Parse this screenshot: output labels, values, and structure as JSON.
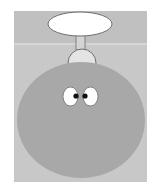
{
  "illustration": {
    "subject": "cartoon bomb character with face",
    "canvas": {
      "width": 161,
      "height": 193,
      "background": "#ffffff"
    },
    "panel": {
      "x": 14,
      "y": 11,
      "width": 133,
      "height": 171
    },
    "colors": {
      "panel_top": "#c0c0c0",
      "panel_bottom": "#c8c8c8",
      "divider": "#e8e8e8",
      "body": "#a8a8a8",
      "cap": "#e4e4e4",
      "neck": "#d4d4d4",
      "balloon": "#ffffff",
      "outline": "#6e6e6e",
      "eye_white": "#ffffff",
      "pupil": "#111111"
    },
    "parts": {
      "balloon": {
        "cx": 80,
        "cy": 24,
        "rx": 32,
        "ry": 12
      },
      "divider_y": 44,
      "neck": {
        "x": 76,
        "y": 35,
        "width": 9,
        "height": 15
      },
      "cap": {
        "cx": 82,
        "cy": 63,
        "rx": 14,
        "ry": 14
      },
      "body": {
        "cx": 81,
        "cy": 120,
        "rx": 64,
        "ry": 58
      },
      "eyes": [
        {
          "name": "left",
          "cx": 70.5,
          "cy": 96.5,
          "rx": 7.5,
          "ry": 9.5,
          "pupil_cx": 76,
          "pupil_cy": 96,
          "pupil_r": 2.6
        },
        {
          "name": "right",
          "cx": 90.5,
          "cy": 96.5,
          "rx": 7.5,
          "ry": 9.5,
          "pupil_cx": 85,
          "pupil_cy": 96,
          "pupil_r": 2.6
        }
      ]
    }
  }
}
